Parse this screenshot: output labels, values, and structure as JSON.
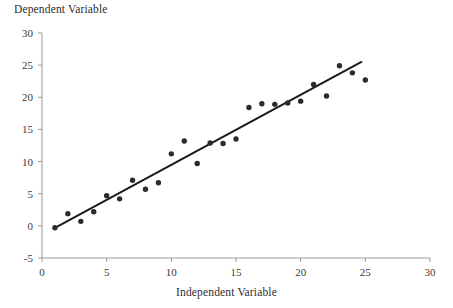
{
  "chart_data": {
    "type": "scatter",
    "title": "",
    "xlabel": "Independent Variable",
    "ylabel": "Dependent Variable",
    "xlim": [
      0,
      30
    ],
    "ylim": [
      -5,
      30
    ],
    "xticks": [
      0,
      5,
      10,
      15,
      20,
      25,
      30
    ],
    "yticks": [
      -5,
      0,
      5,
      10,
      15,
      20,
      25,
      30
    ],
    "xtick_labels": [
      "0",
      "5",
      "10",
      "15",
      "20",
      "25",
      "30"
    ],
    "ytick_labels": [
      "-5",
      "0",
      "5",
      "10",
      "15",
      "20",
      "25",
      "30"
    ],
    "grid": false,
    "legend": false,
    "marker": "filled-circle",
    "marker_color": "#2b2b2b",
    "line_color": "#1a1a1a",
    "axis_color": "#9a9a9a",
    "x": [
      1,
      2,
      3,
      4,
      5,
      6,
      7,
      8,
      9,
      10,
      11,
      12,
      13,
      14,
      15,
      16,
      17,
      18,
      19,
      20,
      21,
      22,
      23,
      24,
      25
    ],
    "values": [
      -0.3,
      1.9,
      0.7,
      2.2,
      4.7,
      4.2,
      7.1,
      5.7,
      6.7,
      11.2,
      13.2,
      9.7,
      12.9,
      12.8,
      13.5,
      18.4,
      19.0,
      18.9,
      19.1,
      19.4,
      22.0,
      20.2,
      24.9,
      23.8,
      22.7
    ],
    "series": [
      {
        "name": "observations",
        "type": "scatter",
        "x": [
          1,
          2,
          3,
          4,
          5,
          6,
          7,
          8,
          9,
          10,
          11,
          12,
          13,
          14,
          15,
          16,
          17,
          18,
          19,
          20,
          21,
          22,
          23,
          24,
          25
        ],
        "values": [
          -0.3,
          1.9,
          0.7,
          2.2,
          4.7,
          4.2,
          7.1,
          5.7,
          6.7,
          11.2,
          13.2,
          9.7,
          12.9,
          12.8,
          13.5,
          18.4,
          19.0,
          18.9,
          19.1,
          19.4,
          22.0,
          20.2,
          24.9,
          23.8,
          22.7
        ]
      },
      {
        "name": "trend-line",
        "type": "line",
        "x": [
          1,
          24.7
        ],
        "values": [
          -0.3,
          25.5
        ]
      }
    ]
  },
  "labels": {
    "y_axis_title": "Dependent Variable",
    "x_axis_title": "Independent Variable"
  }
}
